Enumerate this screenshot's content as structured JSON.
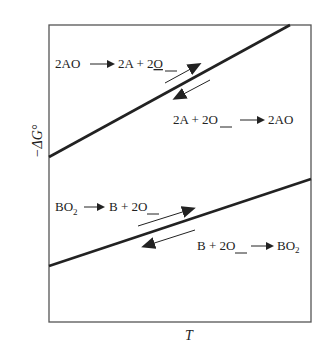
{
  "diagram": {
    "type": "ellingham-style free energy vs temperature",
    "axes": {
      "y_label": "−ΔG°",
      "x_label": "T"
    },
    "lines": [
      {
        "id": "AO",
        "upper_label": {
          "left": "2AO",
          "right": "2A + 2",
          "underlined": "O"
        },
        "lower_label": {
          "left": "2A + 2",
          "underlined": "O",
          "right": "2AO"
        }
      },
      {
        "id": "BO2",
        "upper_label": {
          "left": "BO",
          "left_sub": "2",
          "right": "B + 2",
          "underlined": "O"
        },
        "lower_label": {
          "left": "B + 2",
          "underlined": "O",
          "right": "BO",
          "right_sub": "2"
        }
      }
    ],
    "colors": {
      "line": "#222222",
      "frame": "#555555",
      "text": "#222222"
    }
  }
}
